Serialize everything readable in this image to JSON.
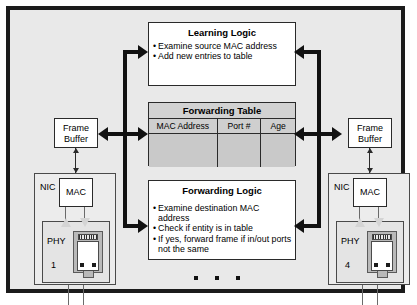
{
  "diagram": {
    "colors": {
      "chassis_border": "#1b1b1b",
      "chassis_fill": "#e9e9e9",
      "box_fill": "#ffffff",
      "table_fill": "#c9c9c9",
      "bus": "#111111"
    }
  },
  "learning_logic": {
    "title": "Learning Logic",
    "bullets": [
      "Examine source MAC address",
      "Add new entries to table"
    ]
  },
  "forwarding_table": {
    "title": "Forwarding Table",
    "columns": [
      "MAC Address",
      "Port #",
      "Age"
    ],
    "rows": []
  },
  "forwarding_logic": {
    "title": "Forwarding Logic",
    "bullets": [
      "Examine destination MAC address",
      "Check if entity is in table",
      "If yes, forward frame if in/out ports not the same"
    ]
  },
  "ports": {
    "left": {
      "frame_buffer": {
        "line1": "Frame",
        "line2": "Buffer"
      },
      "nic_label": "NIC",
      "mac_label": "MAC",
      "phy_label": "PHY",
      "port_number": "1"
    },
    "right": {
      "frame_buffer": {
        "line1": "Frame",
        "line2": "Buffer"
      },
      "nic_label": "NIC",
      "mac_label": "MAC",
      "phy_label": "PHY",
      "port_number": "4"
    }
  },
  "ellipsis": {
    "label": "additional ports omitted",
    "dot_count": 3
  }
}
